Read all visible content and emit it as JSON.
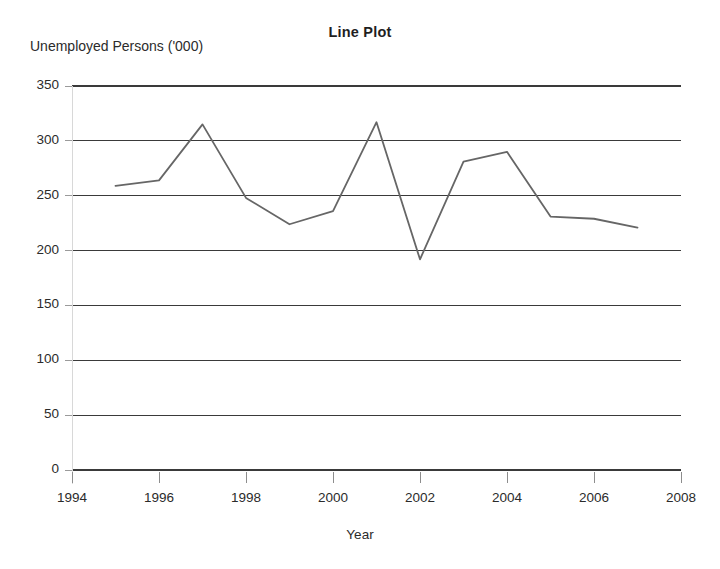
{
  "chart_data": {
    "type": "line",
    "title": "Line Plot",
    "xlabel": "Year",
    "ylabel": "Unemployed Persons ('000)",
    "x": [
      1995,
      1996,
      1997,
      1998,
      1999,
      2000,
      2001,
      2002,
      2003,
      2004,
      2005,
      2006,
      2007
    ],
    "values": [
      259,
      264,
      315,
      248,
      224,
      236,
      317,
      192,
      281,
      290,
      231,
      229,
      221
    ],
    "series": [
      {
        "name": "Unemployed Persons",
        "values": [
          259,
          264,
          315,
          248,
          224,
          236,
          317,
          192,
          281,
          290,
          231,
          229,
          221
        ]
      }
    ],
    "xlim": [
      1994,
      2008
    ],
    "ylim": [
      0,
      350
    ],
    "xticks": [
      1994,
      1996,
      1998,
      2000,
      2002,
      2004,
      2006,
      2008
    ],
    "xtick_labels": [
      "1994",
      "1996",
      "1998",
      "2000",
      "2002",
      "2004",
      "2006",
      "2008"
    ],
    "yticks": [
      0,
      50,
      100,
      150,
      200,
      250,
      300,
      350
    ],
    "ytick_labels": [
      "0",
      "50",
      "100",
      "150",
      "200",
      "250",
      "300",
      "350"
    ],
    "grid": "horizontal",
    "legend": "none",
    "line_color": "#666666",
    "axis_color": "#3a3a3a",
    "background": "#ffffff"
  }
}
